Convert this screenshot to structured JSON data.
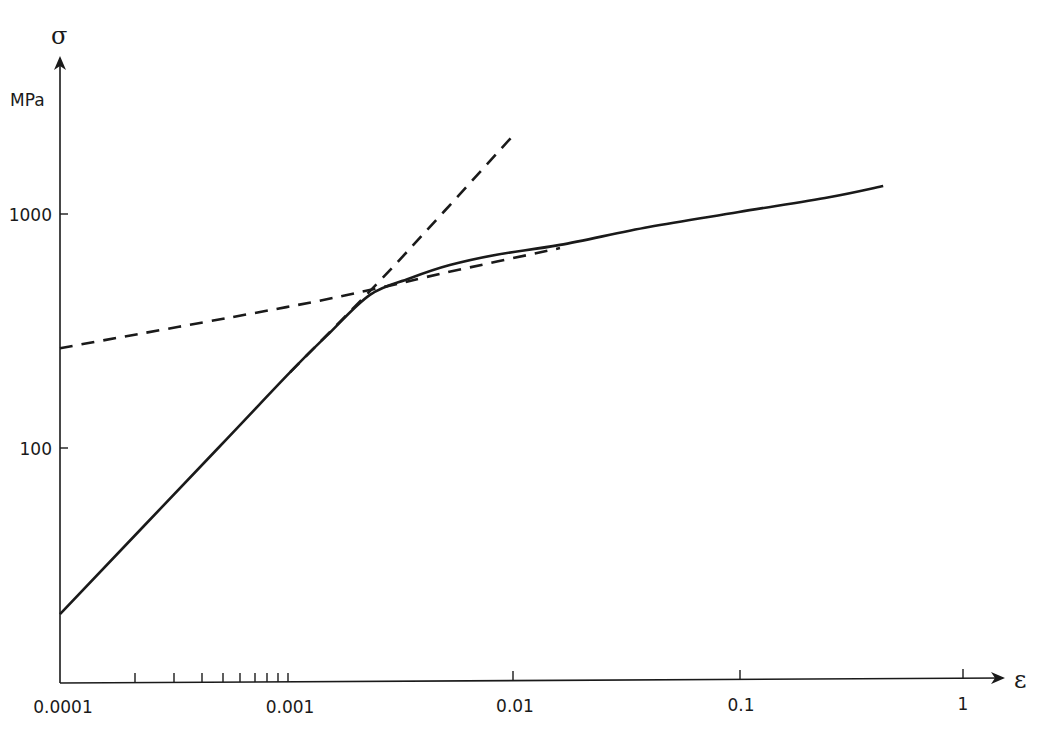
{
  "chart_data": {
    "type": "line",
    "title": "",
    "xlabel": "ε",
    "ylabel": "σ",
    "y_unit": "MPa",
    "xscale": "log",
    "yscale": "log",
    "xlim": [
      0.0001,
      1
    ],
    "ylim": [
      12,
      3000
    ],
    "grid": false,
    "legend": "none",
    "x_ticks": [
      "0.0001",
      "0.001",
      "0.01",
      "0.1",
      "1"
    ],
    "y_ticks": [
      "100",
      "1000"
    ],
    "series": [
      {
        "name": "stress-strain curve",
        "style": "solid",
        "x": [
          0.0001,
          0.0005,
          0.00104,
          0.0015,
          0.00234,
          0.0035,
          0.00528,
          0.0085,
          0.0162,
          0.04,
          0.1,
          0.25,
          0.434
        ],
        "y": [
          19.5,
          100,
          211,
          300,
          451,
          530,
          605,
          670,
          738,
          880,
          1020,
          1180,
          1317
        ]
      },
      {
        "name": "elastic asymptote",
        "style": "dashed",
        "x": [
          0.00104,
          0.0025,
          0.005,
          0.01
        ],
        "y": [
          211,
          500,
          1030,
          2155
        ]
      },
      {
        "name": "plastic asymptote",
        "style": "dashed",
        "x": [
          0.0001,
          0.001,
          0.0025,
          0.005,
          0.0162
        ],
        "y": [
          267,
          400,
          480,
          560,
          715
        ]
      }
    ]
  },
  "labels": {
    "sigma": "σ",
    "unit": "MPa",
    "epsilon": "ε",
    "y1000": "1000",
    "y100": "100",
    "x1": "0.0001",
    "x2": "0.001",
    "x3": "0.01",
    "x4": "0.1",
    "x5": "1"
  }
}
